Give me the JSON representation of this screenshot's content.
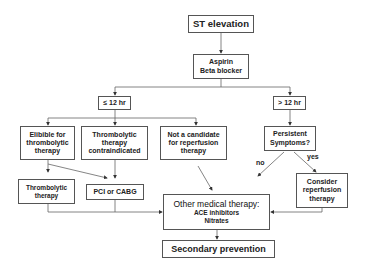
{
  "diagram": {
    "nodes": {
      "st_elevation": {
        "lines": [
          "ST elevation"
        ]
      },
      "aspirin": {
        "lines": [
          "Aspirin",
          "Beta blocker"
        ]
      },
      "le12": {
        "lines": [
          "≤ 12 hr"
        ]
      },
      "gt12": {
        "lines": [
          "> 12 hr"
        ]
      },
      "eligible": {
        "lines": [
          "Elibible for",
          "thrombolytic",
          "therapy"
        ]
      },
      "contraindicated": {
        "lines": [
          "Thrombolytic",
          "therapy",
          "contraindicated"
        ]
      },
      "not_candidate": {
        "lines": [
          "Not a candidate",
          "for reperfusion",
          "therapy"
        ]
      },
      "persistent": {
        "lines": [
          "Persistent",
          "Symptoms?"
        ]
      },
      "thrombolytic": {
        "lines": [
          "Thrombolytic",
          "therapy"
        ]
      },
      "pci": {
        "lines": [
          "PCI or CABG"
        ]
      },
      "other_medical": {
        "lines": [
          "Other medical therapy:",
          "ACE inhibitors",
          "Nitrates"
        ]
      },
      "consider": {
        "lines": [
          "Consider",
          "reperfusion",
          "therapy"
        ]
      },
      "secondary": {
        "lines": [
          "Secondary prevention"
        ]
      }
    },
    "edge_labels": {
      "no": "no",
      "yes": "yes"
    }
  }
}
